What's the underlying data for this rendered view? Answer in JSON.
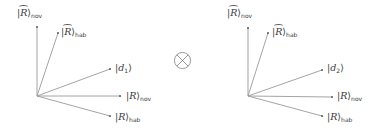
{
  "diagram": {
    "operator": "⊗",
    "colors": {
      "line": "#9a9a9a",
      "text": "#3a3a3a"
    },
    "left": {
      "origin": [
        37,
        96
      ],
      "vectors": [
        {
          "id": "R_tilde_nov",
          "ket": "R",
          "tilde": true,
          "sub": "nov",
          "end": [
            37,
            27
          ],
          "label_pos": [
            17,
            8
          ]
        },
        {
          "id": "R_tilde_hab",
          "ket": "R",
          "tilde": true,
          "sub": "hab",
          "end": [
            58,
            33
          ],
          "label_pos": [
            61,
            27
          ]
        },
        {
          "id": "d1",
          "ket": "d",
          "tilde": false,
          "sub": "1",
          "end": [
            110,
            69
          ],
          "label_pos": [
            115,
            63
          ]
        },
        {
          "id": "R_nov",
          "ket": "R",
          "tilde": false,
          "sub": "nov",
          "end": [
            120,
            96
          ],
          "label_pos": [
            126,
            91
          ]
        },
        {
          "id": "R_hab",
          "ket": "R",
          "tilde": false,
          "sub": "hab",
          "end": [
            110,
            116
          ],
          "label_pos": [
            115,
            112
          ]
        }
      ],
      "labels": {
        "R_tilde_nov": {
          "ket": "R",
          "sub": "nov"
        },
        "R_tilde_hab": {
          "ket": "R",
          "sub": "hab"
        },
        "d1": {
          "ket": "d",
          "sub": "1"
        },
        "R_nov": {
          "ket": "R",
          "sub": "nov"
        },
        "R_hab": {
          "ket": "R",
          "sub": "hab"
        }
      }
    },
    "right": {
      "origin": [
        248,
        96
      ],
      "vectors": [
        {
          "id": "R_tilde_nov",
          "ket": "R",
          "tilde": true,
          "sub": "nov",
          "end": [
            248,
            28
          ],
          "label_pos": [
            227,
            8
          ]
        },
        {
          "id": "R_tilde_hab",
          "ket": "R",
          "tilde": true,
          "sub": "hab",
          "end": [
            268,
            33
          ],
          "label_pos": [
            272,
            27
          ]
        },
        {
          "id": "d2",
          "ket": "d",
          "tilde": false,
          "sub": "2",
          "end": [
            322,
            70
          ],
          "label_pos": [
            327,
            63
          ]
        },
        {
          "id": "R_nov",
          "ket": "R",
          "tilde": false,
          "sub": "nov",
          "end": [
            332,
            97
          ],
          "label_pos": [
            337,
            91
          ]
        },
        {
          "id": "R_hab",
          "ket": "R",
          "tilde": false,
          "sub": "hab",
          "end": [
            322,
            116
          ],
          "label_pos": [
            327,
            112
          ]
        }
      ],
      "labels": {
        "R_tilde_nov": {
          "ket": "R",
          "sub": "nov"
        },
        "R_tilde_hab": {
          "ket": "R",
          "sub": "hab"
        },
        "d2": {
          "ket": "d",
          "sub": "2"
        },
        "R_nov": {
          "ket": "R",
          "sub": "nov"
        },
        "R_hab": {
          "ket": "R",
          "sub": "hab"
        }
      }
    }
  }
}
